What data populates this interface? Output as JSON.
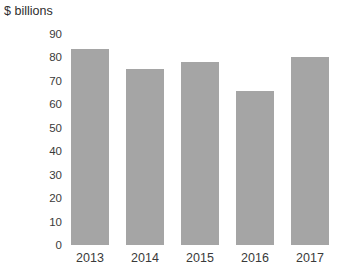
{
  "chart_data": {
    "type": "bar",
    "title": "$ billions",
    "xlabel": "",
    "ylabel": "$ billions",
    "categories": [
      "2013",
      "2014",
      "2015",
      "2016",
      "2017"
    ],
    "values": [
      83.5,
      75,
      78,
      65.5,
      80
    ],
    "series": [
      {
        "name": "$ billions",
        "values": [
          83.5,
          75,
          78,
          65.5,
          80
        ]
      }
    ],
    "ylim": [
      0,
      90
    ],
    "ytick_labels": [
      "90",
      "80",
      "70",
      "60",
      "50",
      "40",
      "30",
      "20",
      "10",
      "0"
    ],
    "ytick_values": [
      90,
      80,
      70,
      60,
      50,
      40,
      30,
      20,
      10,
      0
    ],
    "grid": false,
    "legend": false,
    "legend_position": "none",
    "bar_color": "#a5a5a5",
    "background_color": "#ffffff",
    "text_color": "#3a3a3a"
  }
}
